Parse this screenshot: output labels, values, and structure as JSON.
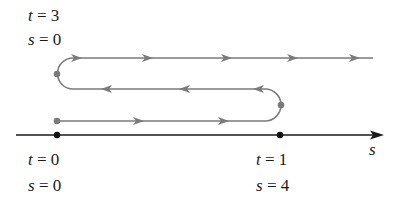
{
  "labels": {
    "top_t": "t = 3",
    "top_s": "s = 0",
    "bottom_left_t": "t = 0",
    "bottom_left_s": "s = 0",
    "bottom_right_t": "t = 1",
    "bottom_right_s": "s = 4",
    "axis": "s"
  },
  "colors": {
    "path": "#7a7a7a",
    "axis": "#1a1a1a",
    "background": "#ffffff"
  }
}
